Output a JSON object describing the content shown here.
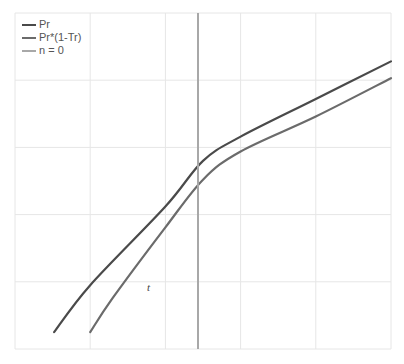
{
  "chart_data": {
    "type": "line",
    "title": "",
    "xlabel": "",
    "ylabel": "",
    "xlim": [
      0,
      5
    ],
    "ylim": [
      0,
      5
    ],
    "grid": true,
    "legend_position": "upper-left",
    "tick_labels_visible": false,
    "series": [
      {
        "name": "Pr",
        "color": "#4a4a4a",
        "x": [
          0.52,
          1.0,
          2.0,
          2.5,
          3.0,
          4.0,
          5.0
        ],
        "y": [
          0.25,
          0.95,
          2.12,
          2.8,
          3.16,
          3.72,
          4.28
        ]
      },
      {
        "name": "Pr*(1-Tr)",
        "color": "#6b6b6b",
        "x": [
          1.0,
          1.3,
          2.0,
          2.5,
          3.0,
          4.0,
          5.0
        ],
        "y": [
          0.25,
          0.76,
          1.81,
          2.52,
          2.94,
          3.46,
          4.03
        ]
      },
      {
        "name": "n = 0",
        "color": "#a8a8a8",
        "type": "vertical-line",
        "x": 2.5
      }
    ],
    "annotations": [
      {
        "text": "t",
        "x": 1.8,
        "y": 0.9
      }
    ]
  },
  "legend": {
    "items": [
      {
        "label": "Pr",
        "color": "#4a4a4a"
      },
      {
        "label": "Pr*(1-Tr)",
        "color": "#6b6b6b"
      },
      {
        "label": "n = 0",
        "color": "#a8a8a8"
      }
    ]
  },
  "annotation_t": "t"
}
